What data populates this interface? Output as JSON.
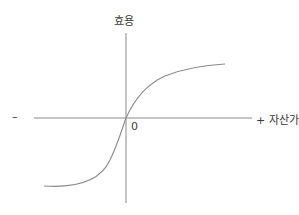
{
  "diagram": {
    "title": "",
    "y_axis_label": "효용",
    "x_axis_label": "+ 자산가치",
    "x_negative_label": "–",
    "origin_label": "0",
    "colors": {
      "axis": "#8a8a8a",
      "curve": "#8a8a8a",
      "text": "#3a3a3a"
    },
    "curve": {
      "description": "S-shaped value function: concave for gains, convex for losses, steeper in losses",
      "points_px": [
        [
          50,
          183
        ],
        [
          90,
          178
        ],
        [
          110,
          163
        ],
        [
          126,
          118
        ],
        [
          140,
          90
        ],
        [
          175,
          72
        ],
        [
          225,
          64
        ]
      ]
    }
  }
}
